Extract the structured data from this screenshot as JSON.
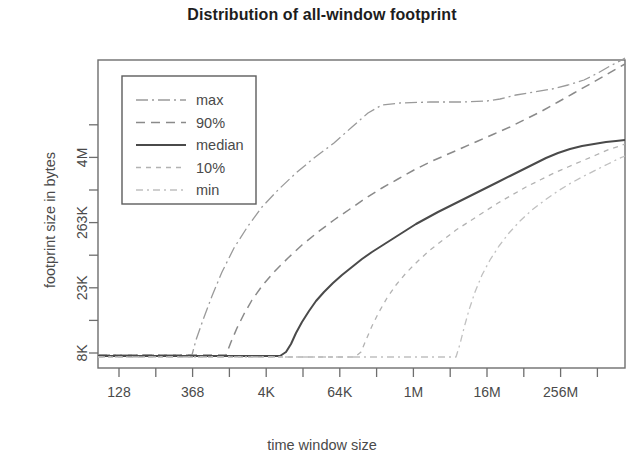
{
  "chart_data": {
    "type": "line",
    "title": "Distribution of all-window footprint",
    "xlabel": "time window size",
    "ylabel": "footprint size in bytes",
    "grid": false,
    "legend_position": "top-left",
    "x_tick_labels": [
      "128",
      "368",
      "4K",
      "64K",
      "1M",
      "16M",
      "256M"
    ],
    "x_all_ticks": 14,
    "x_labeled_tick_indices": [
      0,
      2,
      4,
      6,
      8,
      10,
      12
    ],
    "y_tick_labels": [
      "8K",
      "23K",
      "263K",
      "4M"
    ],
    "y_all_ticks": 8,
    "y_labeled_tick_indices": [
      0,
      2,
      4,
      6
    ],
    "xlim_labels": [
      "128",
      "256M+"
    ],
    "ylim_labels": [
      "8K",
      "4M+"
    ],
    "series": [
      {
        "name": "max",
        "dash": "dashdot",
        "color": "#9a9a9a",
        "points": [
          [
            98,
            355
          ],
          [
            140,
            355
          ],
          [
            170,
            355
          ],
          [
            192,
            355
          ],
          [
            196,
            340
          ],
          [
            203,
            320
          ],
          [
            212,
            296
          ],
          [
            222,
            272
          ],
          [
            234,
            248
          ],
          [
            248,
            226
          ],
          [
            262,
            207
          ],
          [
            278,
            190
          ],
          [
            296,
            173
          ],
          [
            314,
            158
          ],
          [
            334,
            143
          ],
          [
            352,
            127
          ],
          [
            368,
            113
          ],
          [
            382,
            105
          ],
          [
            400,
            103
          ],
          [
            430,
            102
          ],
          [
            462,
            102
          ],
          [
            487,
            101
          ],
          [
            500,
            99
          ],
          [
            516,
            95
          ],
          [
            534,
            92
          ],
          [
            552,
            89
          ],
          [
            568,
            85
          ],
          [
            584,
            80
          ],
          [
            598,
            73
          ],
          [
            610,
            66
          ],
          [
            620,
            61
          ],
          [
            625,
            58
          ]
        ]
      },
      {
        "name": "90%",
        "dash": "dashed",
        "color": "#8a8a8a",
        "points": [
          [
            98,
            355
          ],
          [
            180,
            355
          ],
          [
            226,
            355
          ],
          [
            231,
            342
          ],
          [
            237,
            328
          ],
          [
            244,
            314
          ],
          [
            252,
            300
          ],
          [
            262,
            286
          ],
          [
            274,
            272
          ],
          [
            288,
            258
          ],
          [
            302,
            245
          ],
          [
            318,
            232
          ],
          [
            334,
            220
          ],
          [
            350,
            209
          ],
          [
            366,
            198
          ],
          [
            382,
            188
          ],
          [
            398,
            179
          ],
          [
            414,
            170
          ],
          [
            430,
            162
          ],
          [
            446,
            155
          ],
          [
            462,
            148
          ],
          [
            478,
            141
          ],
          [
            494,
            134
          ],
          [
            510,
            127
          ],
          [
            526,
            119
          ],
          [
            542,
            111
          ],
          [
            558,
            102
          ],
          [
            574,
            93
          ],
          [
            590,
            84
          ],
          [
            604,
            76
          ],
          [
            616,
            69
          ],
          [
            625,
            64
          ]
        ]
      },
      {
        "name": "median",
        "dash": "solid",
        "color": "#4a4a4a",
        "points": [
          [
            98,
            356
          ],
          [
            200,
            356
          ],
          [
            280,
            356
          ],
          [
            286,
            352
          ],
          [
            291,
            344
          ],
          [
            296,
            333
          ],
          [
            302,
            322
          ],
          [
            309,
            311
          ],
          [
            316,
            301
          ],
          [
            324,
            292
          ],
          [
            333,
            283
          ],
          [
            342,
            275
          ],
          [
            352,
            267
          ],
          [
            362,
            259
          ],
          [
            372,
            252
          ],
          [
            383,
            245
          ],
          [
            394,
            238
          ],
          [
            405,
            231
          ],
          [
            416,
            224
          ],
          [
            427,
            218
          ],
          [
            438,
            212
          ],
          [
            450,
            206
          ],
          [
            462,
            200
          ],
          [
            474,
            194
          ],
          [
            486,
            188
          ],
          [
            498,
            182
          ],
          [
            510,
            176
          ],
          [
            522,
            170
          ],
          [
            534,
            164
          ],
          [
            546,
            158
          ],
          [
            558,
            153
          ],
          [
            570,
            149
          ],
          [
            582,
            146
          ],
          [
            594,
            144
          ],
          [
            606,
            142
          ],
          [
            616,
            141
          ],
          [
            625,
            140
          ]
        ]
      },
      {
        "name": "10%",
        "dash": "dotted",
        "color": "#b2b2b2",
        "points": [
          [
            98,
            357
          ],
          [
            250,
            357
          ],
          [
            355,
            357
          ],
          [
            361,
            352
          ],
          [
            366,
            340
          ],
          [
            372,
            326
          ],
          [
            379,
            312
          ],
          [
            387,
            298
          ],
          [
            396,
            285
          ],
          [
            406,
            273
          ],
          [
            418,
            261
          ],
          [
            430,
            250
          ],
          [
            443,
            240
          ],
          [
            456,
            230
          ],
          [
            470,
            221
          ],
          [
            484,
            212
          ],
          [
            498,
            203
          ],
          [
            512,
            195
          ],
          [
            526,
            187
          ],
          [
            540,
            180
          ],
          [
            554,
            173
          ],
          [
            568,
            167
          ],
          [
            582,
            161
          ],
          [
            596,
            155
          ],
          [
            610,
            149
          ],
          [
            620,
            146
          ],
          [
            625,
            144
          ]
        ]
      },
      {
        "name": "min",
        "dash": "dashdotfine",
        "color": "#c0c0c0",
        "points": [
          [
            98,
            357
          ],
          [
            300,
            357
          ],
          [
            430,
            357
          ],
          [
            456,
            357
          ],
          [
            460,
            344
          ],
          [
            464,
            328
          ],
          [
            469,
            310
          ],
          [
            475,
            292
          ],
          [
            482,
            275
          ],
          [
            490,
            260
          ],
          [
            499,
            246
          ],
          [
            509,
            233
          ],
          [
            520,
            221
          ],
          [
            532,
            210
          ],
          [
            545,
            200
          ],
          [
            558,
            191
          ],
          [
            571,
            183
          ],
          [
            584,
            176
          ],
          [
            596,
            170
          ],
          [
            608,
            164
          ],
          [
            618,
            159
          ],
          [
            625,
            156
          ]
        ]
      }
    ]
  },
  "legend": {
    "entries": [
      {
        "label": "max"
      },
      {
        "label": "90%"
      },
      {
        "label": "median"
      },
      {
        "label": "10%"
      },
      {
        "label": "min"
      }
    ]
  }
}
